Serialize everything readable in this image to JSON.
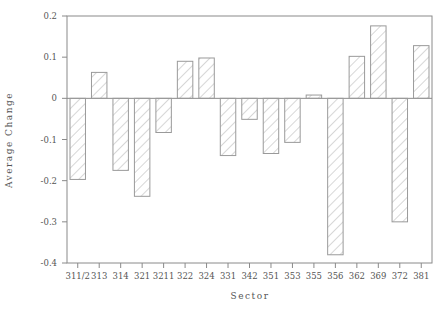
{
  "chart_data": {
    "type": "bar",
    "title": "",
    "xlabel": "Sector",
    "ylabel": "Average Change",
    "ylim": [
      -0.4,
      0.2
    ],
    "yticks": [
      0.2,
      0.1,
      0,
      -0.1,
      -0.2,
      -0.3,
      -0.4
    ],
    "ytick_labels": [
      "0.2",
      "0.1",
      "0",
      "-0.1",
      "-0.2",
      "-0.3",
      "-0.4"
    ],
    "grid": false,
    "legend": null,
    "bar_fill": "diagonal-hatch",
    "categories": [
      "311/2",
      "313",
      "314",
      "321",
      "3211",
      "322",
      "324",
      "331",
      "342",
      "351",
      "353",
      "355",
      "356",
      "362",
      "369",
      "372",
      "381"
    ],
    "values": [
      -0.197,
      0.063,
      -0.175,
      -0.238,
      -0.083,
      0.09,
      0.098,
      -0.139,
      -0.051,
      -0.134,
      -0.107,
      0.008,
      -0.38,
      0.102,
      0.176,
      -0.3,
      0.128
    ]
  }
}
